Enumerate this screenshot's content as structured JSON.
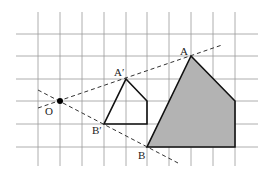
{
  "diagram": {
    "type": "homothety / dilation on grid",
    "grid": {
      "v_lines_x": [
        38,
        60,
        82,
        104,
        126,
        147,
        169,
        191,
        213,
        235
      ],
      "h_lines_y": [
        34,
        56,
        79,
        101,
        124,
        147
      ],
      "x_extent": [
        16,
        258
      ],
      "y_extent": [
        12,
        166
      ],
      "color": "#9a9a9a"
    },
    "center": {
      "label": "O",
      "x": 60,
      "y": 101
    },
    "small_shape": {
      "points": "126,79 147,101 147,124 104,124",
      "stroke": "#111111",
      "fill": "none"
    },
    "large_shape": {
      "points": "191,56 235,101 235,147 147,147",
      "stroke": "#111111",
      "fill": "#b3b3b3"
    },
    "rays": [
      {
        "name": "ray-OA",
        "x1": 38,
        "y1": 108,
        "x2": 222,
        "y2": 45
      },
      {
        "name": "ray-OB",
        "x1": 38,
        "y1": 90,
        "x2": 178,
        "y2": 163
      }
    ],
    "labels": {
      "O": "O",
      "A_prime": "A′",
      "B_prime": "B′",
      "A": "A",
      "B": "B"
    }
  }
}
